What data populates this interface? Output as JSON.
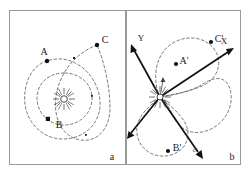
{
  "figure": {
    "width": 250,
    "height": 174,
    "background": "#ffffff",
    "border_color": "#9a9a9a",
    "ink_color": "#1a1a1a",
    "orbit_color": "#555555"
  },
  "panels": [
    {
      "id": "a",
      "caption": "a",
      "caption_pos": {
        "x": 112,
        "y": 160
      },
      "frame": {
        "x": 9,
        "y": 10,
        "w": 117,
        "h": 155
      },
      "star": {
        "x": 64,
        "y": 99,
        "label": "sun"
      },
      "bodies": [
        {
          "name": "A",
          "label": "A",
          "marker_x": 47,
          "marker_y": 61,
          "label_x": 47,
          "label_y": 54
        },
        {
          "name": "B",
          "label": "B",
          "marker_x": 48,
          "marker_y": 119,
          "label_x": 57,
          "label_y": 127
        },
        {
          "name": "C",
          "label": "C",
          "marker_x": 97,
          "marker_y": 45,
          "label_x": 103,
          "label_y": 44
        }
      ],
      "orbit_count": 3,
      "orbit_style": "dashed-ellipse"
    },
    {
      "id": "b",
      "caption": "b",
      "caption_pos": {
        "x": 232,
        "y": 160
      },
      "frame": {
        "x": 127,
        "y": 10,
        "w": 114,
        "h": 155
      },
      "star": {
        "x": 160,
        "y": 97,
        "label": "sun"
      },
      "bodies": [
        {
          "name": "A-prime",
          "label": "A'",
          "marker_x": 176,
          "marker_y": 64,
          "label_x": 181,
          "label_y": 63
        },
        {
          "name": "B-prime",
          "label": "B'",
          "marker_x": 168,
          "marker_y": 151,
          "label_x": 173,
          "label_y": 150
        },
        {
          "name": "C-prime",
          "label": "C'",
          "marker_x": 211,
          "marker_y": 42,
          "label_x": 216,
          "label_y": 42
        }
      ],
      "axes": [
        {
          "name": "Y",
          "label": "Y",
          "label_x": 139,
          "label_y": 40,
          "from_x": 160,
          "from_y": 97,
          "to_x": 131,
          "to_y": 46
        },
        {
          "name": "X",
          "label": "X",
          "label_x": 224,
          "label_y": 43,
          "from_x": 160,
          "from_y": 97,
          "to_x": 233,
          "to_y": 48
        },
        {
          "name": "minus-Y",
          "label": "",
          "label_x": 0,
          "label_y": 0,
          "from_x": 160,
          "from_y": 97,
          "to_x": 126,
          "to_y": 138
        },
        {
          "name": "minus-X",
          "label": "",
          "label_x": 0,
          "label_y": 0,
          "from_x": 160,
          "from_y": 97,
          "to_x": 202,
          "to_y": 158
        }
      ],
      "annotations": [
        {
          "name": "c-prime-small",
          "label": "c'",
          "x": 195,
          "y": 151
        }
      ],
      "orbit_count": 3,
      "orbit_style": "dashed-ellipse"
    }
  ]
}
